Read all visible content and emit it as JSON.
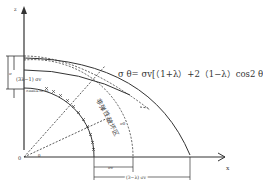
{
  "diagram": {
    "top_caption_cropped": "",
    "axes": {
      "x_label": "x",
      "z_label": "z",
      "origin_label": "0"
    },
    "formula": "σ θ= σv[（1+λ）+2（1−λ）cos2 θ]",
    "labels": {
      "left_dimension": "(3λ−1) σv",
      "left_small": "σ",
      "inner_arc_label": "σmax=3λ σv",
      "angle_label": "θ",
      "region_label": "非弹性破坏区",
      "sigma_theta_label": "σθ",
      "bottom_dim_1": "σv",
      "bottom_dim_2": "(3−λ) σv"
    },
    "colors": {
      "line": "#333333",
      "background": "#ffffff"
    }
  }
}
